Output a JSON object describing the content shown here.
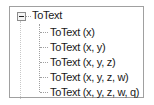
{
  "tree": {
    "root": {
      "label": "ToText",
      "expanded": true,
      "toggle_icon": "minus-box-icon"
    },
    "children": [
      {
        "label": "ToText (x)"
      },
      {
        "label": "ToText (x, y)"
      },
      {
        "label": "ToText (x, y, z)"
      },
      {
        "label": "ToText (x, y, z, w)"
      },
      {
        "label": "ToText (x, y, z, w, q)"
      }
    ]
  },
  "colors": {
    "border": "#a0a0a0",
    "text": "#1a1a1a",
    "connector": "#a0a0a0"
  }
}
